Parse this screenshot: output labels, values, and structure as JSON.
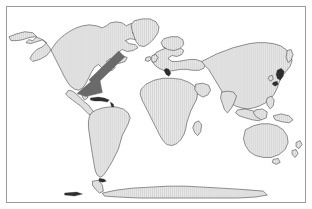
{
  "document": {
    "type": "world-map-figure",
    "title": "World map with location pointer",
    "projection": "equirectangular-world"
  },
  "frame": {
    "border_color": "#9a9a9a",
    "background_color": "#ffffff",
    "inset_px": 6
  },
  "map": {
    "ocean_color": "#ffffff",
    "land_fill_color": "#e9e9e9",
    "land_hatch_color": "#c2c2c2",
    "land_outline_color": "#3a3a3a",
    "landmasses": [
      {
        "name": "north-america",
        "label": "North America"
      },
      {
        "name": "greenland",
        "label": "Greenland"
      },
      {
        "name": "south-america",
        "label": "South America"
      },
      {
        "name": "africa",
        "label": "Africa"
      },
      {
        "name": "europe",
        "label": "Europe"
      },
      {
        "name": "asia",
        "label": "Asia"
      },
      {
        "name": "australia",
        "label": "Australia"
      },
      {
        "name": "antarctica",
        "label": "Antarctica"
      },
      {
        "name": "indonesia",
        "label": "Indonesia"
      },
      {
        "name": "japan",
        "label": "Japan"
      },
      {
        "name": "madagascar",
        "label": "Madagascar"
      },
      {
        "name": "british-isles",
        "label": "British Isles"
      },
      {
        "name": "new-zealand",
        "label": "New Zealand"
      },
      {
        "name": "iceland",
        "label": "Iceland"
      }
    ]
  },
  "annotation": {
    "pointer": {
      "name": "location-arrow",
      "color": "#6a6a6a",
      "direction": "down-left",
      "target_region": "Southeastern United States / Gulf of Mexico",
      "tail_x": 118,
      "tail_y": 56,
      "tip_x": 78,
      "tip_y": 90
    }
  }
}
